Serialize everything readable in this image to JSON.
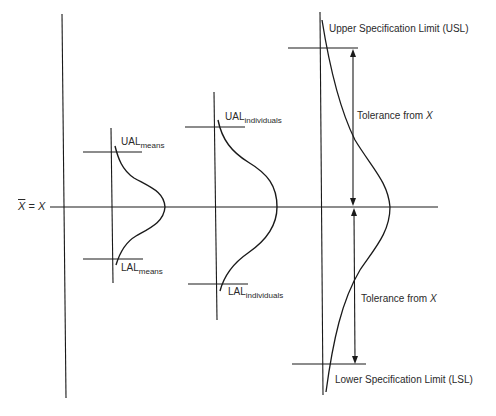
{
  "diagram": {
    "type": "control-limits-vs-specification-limits",
    "centerline_label": {
      "xbar": "X",
      "equals": " = ",
      "x": "X"
    },
    "means": {
      "ual_main": "UAL",
      "ual_sub": "means",
      "lal_main": "LAL",
      "lal_sub": "means"
    },
    "individuals": {
      "ual_main": "UAL",
      "ual_sub": "individuals",
      "lal_main": "LAL",
      "lal_sub": "individuals"
    },
    "specification": {
      "usl_label": "Upper Specification Limit (USL)",
      "lsl_label": "Lower Specification Limit (LSL)",
      "tolerance_upper_prefix": "Tolerance from ",
      "tolerance_upper_var": "X",
      "tolerance_lower_prefix": "Tolerance from ",
      "tolerance_lower_var": "X"
    },
    "colors": {
      "line": "#1a1a1a",
      "background": "#ffffff"
    }
  }
}
